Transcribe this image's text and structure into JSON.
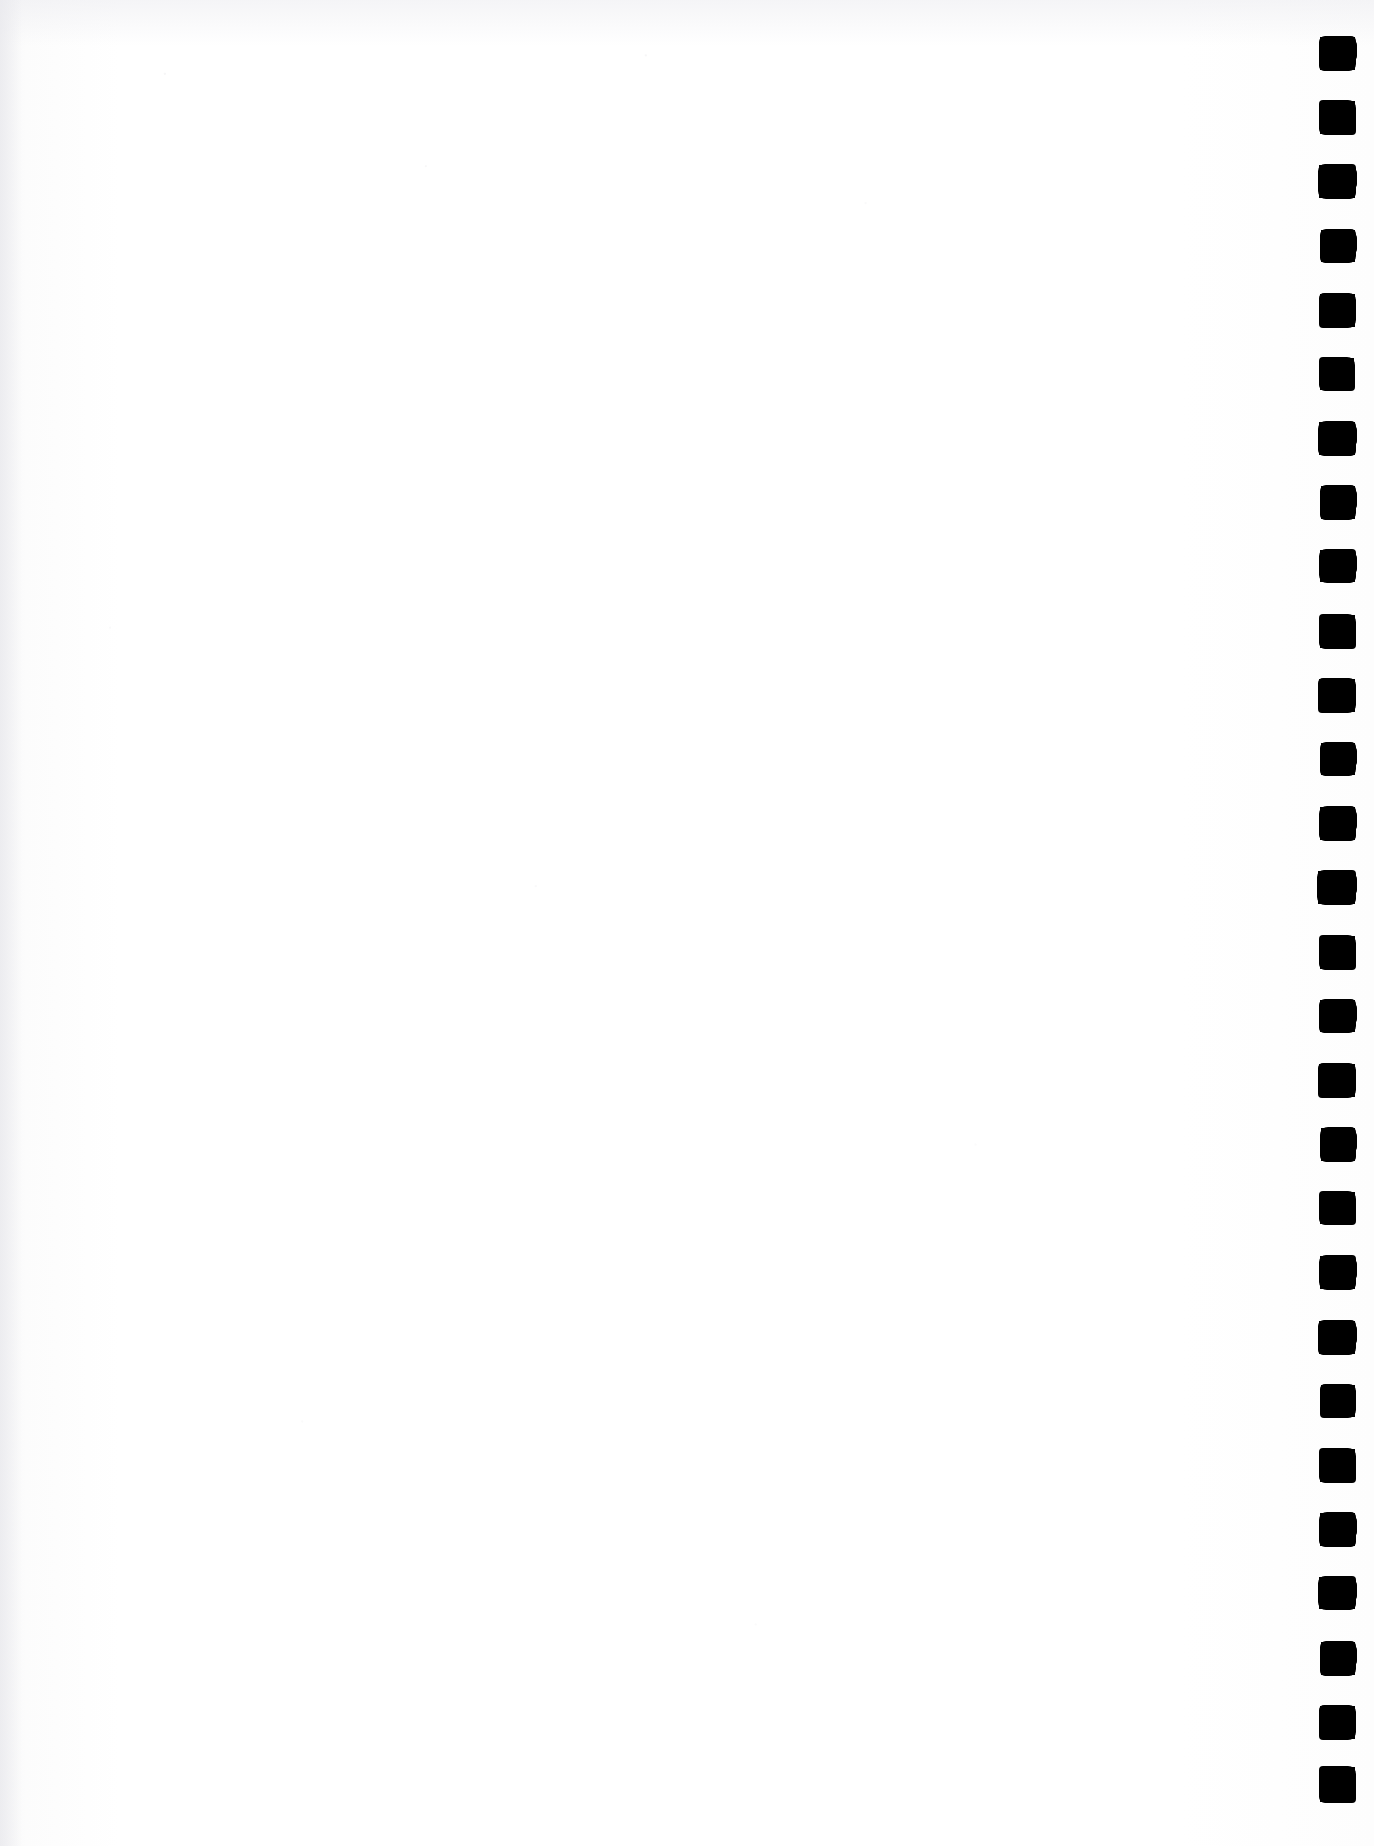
{
  "page": {
    "kind": "scanned-blank-page",
    "width": 1374,
    "height": 1846,
    "background_color": "#fdfdfd",
    "paper_tint": "#f7f7f8",
    "body_text": "",
    "visible_text": ""
  },
  "register_strip": {
    "name": "right-edge-index-marks",
    "ink_color": "#000000",
    "count": 28,
    "mark_width": 35,
    "mark_height": 33,
    "center_x": 1338,
    "first_center_y": 53,
    "pitch": 64.1,
    "marks": [
      {
        "index": 1,
        "x": 1320,
        "y": 37,
        "w": 35,
        "h": 33,
        "variant": "v1"
      },
      {
        "index": 2,
        "x": 1320,
        "y": 101,
        "w": 35,
        "h": 33,
        "variant": "v2"
      },
      {
        "index": 3,
        "x": 1319,
        "y": 165,
        "w": 36,
        "h": 33,
        "variant": "v3"
      },
      {
        "index": 4,
        "x": 1321,
        "y": 230,
        "w": 34,
        "h": 32,
        "variant": "v1"
      },
      {
        "index": 5,
        "x": 1320,
        "y": 294,
        "w": 35,
        "h": 33,
        "variant": "v4"
      },
      {
        "index": 6,
        "x": 1320,
        "y": 358,
        "w": 34,
        "h": 32,
        "variant": "v2"
      },
      {
        "index": 7,
        "x": 1319,
        "y": 422,
        "w": 36,
        "h": 33,
        "variant": "v5"
      },
      {
        "index": 8,
        "x": 1321,
        "y": 486,
        "w": 34,
        "h": 33,
        "variant": "v1"
      },
      {
        "index": 9,
        "x": 1320,
        "y": 550,
        "w": 35,
        "h": 32,
        "variant": "v3"
      },
      {
        "index": 10,
        "x": 1320,
        "y": 615,
        "w": 35,
        "h": 33,
        "variant": "v2"
      },
      {
        "index": 11,
        "x": 1319,
        "y": 679,
        "w": 36,
        "h": 33,
        "variant": "v4"
      },
      {
        "index": 12,
        "x": 1321,
        "y": 743,
        "w": 34,
        "h": 32,
        "variant": "v1"
      },
      {
        "index": 13,
        "x": 1320,
        "y": 807,
        "w": 35,
        "h": 33,
        "variant": "v5"
      },
      {
        "index": 14,
        "x": 1318,
        "y": 871,
        "w": 37,
        "h": 33,
        "variant": "v3"
      },
      {
        "index": 15,
        "x": 1320,
        "y": 936,
        "w": 35,
        "h": 33,
        "variant": "v2"
      },
      {
        "index": 16,
        "x": 1320,
        "y": 1000,
        "w": 35,
        "h": 32,
        "variant": "v1"
      },
      {
        "index": 17,
        "x": 1319,
        "y": 1064,
        "w": 36,
        "h": 33,
        "variant": "v4"
      },
      {
        "index": 18,
        "x": 1321,
        "y": 1128,
        "w": 34,
        "h": 33,
        "variant": "v5"
      },
      {
        "index": 19,
        "x": 1320,
        "y": 1192,
        "w": 35,
        "h": 32,
        "variant": "v2"
      },
      {
        "index": 20,
        "x": 1320,
        "y": 1256,
        "w": 35,
        "h": 33,
        "variant": "v3"
      },
      {
        "index": 21,
        "x": 1319,
        "y": 1321,
        "w": 36,
        "h": 33,
        "variant": "v1"
      },
      {
        "index": 22,
        "x": 1321,
        "y": 1385,
        "w": 34,
        "h": 32,
        "variant": "v4"
      },
      {
        "index": 23,
        "x": 1320,
        "y": 1449,
        "w": 35,
        "h": 33,
        "variant": "v2"
      },
      {
        "index": 24,
        "x": 1320,
        "y": 1513,
        "w": 35,
        "h": 33,
        "variant": "v5"
      },
      {
        "index": 25,
        "x": 1319,
        "y": 1577,
        "w": 36,
        "h": 32,
        "variant": "v3"
      },
      {
        "index": 26,
        "x": 1321,
        "y": 1642,
        "w": 34,
        "h": 33,
        "variant": "v1"
      },
      {
        "index": 27,
        "x": 1320,
        "y": 1706,
        "w": 35,
        "h": 33,
        "variant": "v4"
      },
      {
        "index": 28,
        "x": 1320,
        "y": 1767,
        "w": 35,
        "h": 35,
        "variant": "v2"
      }
    ]
  }
}
